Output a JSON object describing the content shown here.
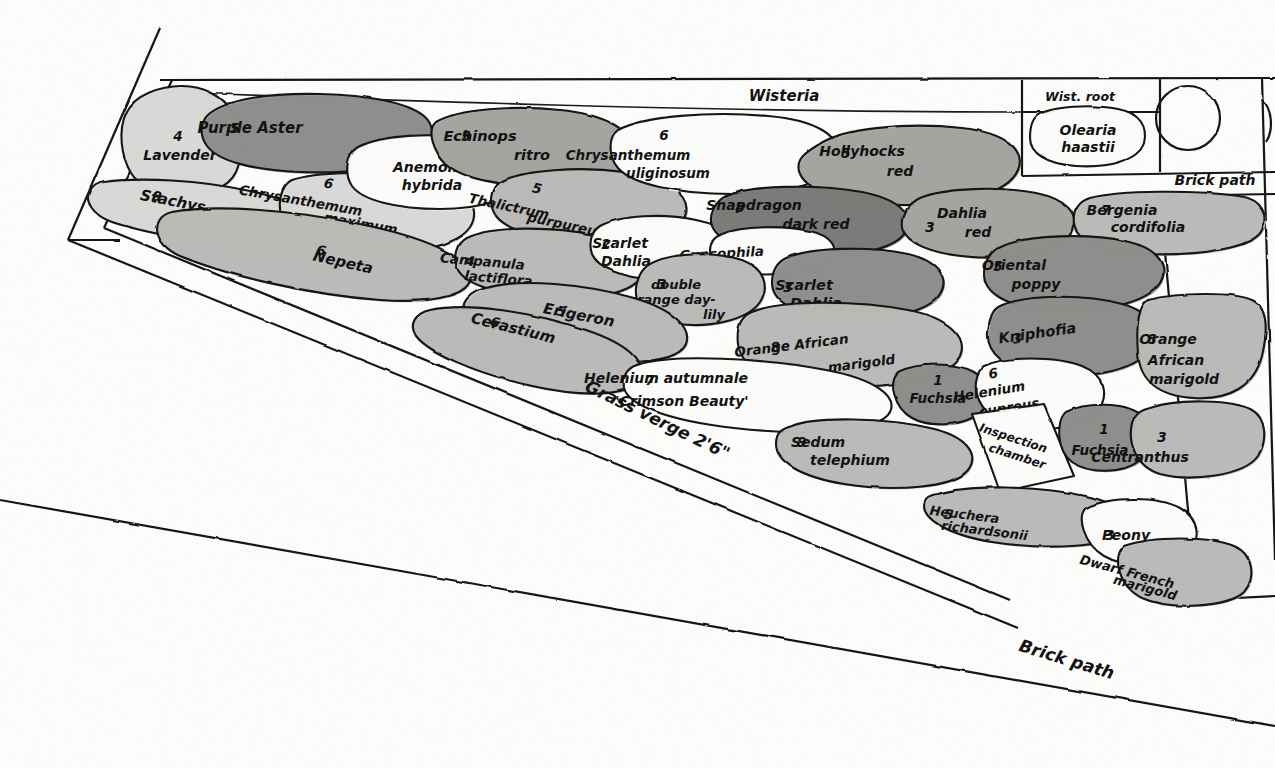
{
  "palette": {
    "paper": "#fdfdfb",
    "ink": "#141414",
    "tone_light": "#d8d8d6",
    "tone_mid": "#b9b9b7",
    "tone_mid_dark": "#a3a3a0",
    "tone_dark": "#8e8e8b",
    "tone_darkest": "#7a7a77",
    "white_bed": "#fbfbf9"
  },
  "structure_labels": [
    {
      "id": "wisteria",
      "text": "Wisteria",
      "x": 784,
      "y": 101,
      "size": 15,
      "rotate": 0,
      "anchor": "middle"
    },
    {
      "id": "wist-root",
      "text": "Wist. root",
      "x": 1080,
      "y": 101,
      "size": 12.5,
      "rotate": 0,
      "anchor": "middle"
    },
    {
      "id": "brick-path-top",
      "text": "Brick path",
      "x": 1215,
      "y": 185,
      "size": 14,
      "rotate": 0,
      "anchor": "middle"
    },
    {
      "id": "brick-path-bottom",
      "text": "Brick path",
      "x": 1065,
      "y": 665,
      "size": 17,
      "rotate": 17,
      "anchor": "middle"
    },
    {
      "id": "grass-verge",
      "text": "Grass verge 2'6\"",
      "x": 655,
      "y": 425,
      "size": 17,
      "rotate": 26,
      "anchor": "middle"
    }
  ],
  "beds": [
    {
      "id": "lavender",
      "qty": "4",
      "name": "Lavender",
      "tone": "tone_light",
      "path": "M126,113 C134,95 160,86 182,86 C203,86 224,96 232,112 C242,131 243,157 236,172 C228,189 204,196 184,195 C161,194 140,188 131,173 C121,156 118,131 126,113 Z",
      "label": {
        "x": 180,
        "y": 148,
        "lines": [
          "4"
        ],
        "sub": "Lavender",
        "numx": 178,
        "numy": 141,
        "textx": 180,
        "texty": 160,
        "size": 14
      }
    },
    {
      "id": "purple-aster",
      "qty": "5",
      "name": "Purple Aster",
      "tone": "tone_dark",
      "path": "M210,113 C230,99 270,93 320,94 C370,95 408,103 424,116 C436,126 434,144 420,154 C400,168 348,174 300,172 C252,170 218,161 207,146 C199,135 200,121 210,113 Z",
      "label": {
        "numx": 235,
        "numy": 133,
        "textx": 250,
        "texty": 133,
        "sub": "",
        "size": 15
      }
    },
    {
      "id": "stachys",
      "qty": "9",
      "name": "Stachys",
      "tone": "tone_light",
      "path": "M104,182 C140,177 200,180 250,191 C292,200 316,214 318,228 C320,243 298,250 262,248 C214,245 148,234 112,222 C92,215 84,200 90,191 C94,185 98,183 104,182 Z",
      "label": {
        "numx": 156,
        "numy": 201,
        "textx": 172,
        "texty": 206,
        "sub": "",
        "size": 15,
        "rotate": 11
      }
    },
    {
      "id": "chrysanthemum-maximum",
      "qty": "6",
      "name": "Chrysanthemum",
      "name2": "maximum",
      "tone": "tone_light",
      "path": "M292,180 C316,172 370,171 414,177 C452,183 476,197 474,216 C472,238 440,250 396,252 C348,254 306,246 290,232 C276,220 276,188 292,180 Z",
      "label": {
        "numx": 328,
        "numy": 188,
        "textx": 300,
        "texty": 205,
        "sub": "maximum",
        "subx": 360,
        "suby": 228,
        "size": 13.5,
        "rotate": 10
      }
    },
    {
      "id": "anemone-hybrida",
      "qty": "6",
      "name": "Anemone",
      "name2": "hybrida",
      "tone": "white_bed",
      "path": "M358,147 C382,135 432,132 470,139 C506,146 520,162 516,180 C512,200 480,209 440,209 C396,209 362,200 352,186 C344,174 346,154 358,147 Z",
      "label": {
        "numx": 440,
        "numy": 153,
        "textx": 430,
        "texty": 172,
        "sub": "hybrida",
        "subx": 432,
        "suby": 190,
        "size": 14
      }
    },
    {
      "id": "echinops-ritro",
      "qty": "5",
      "name": "Echinops",
      "name2": "ritro",
      "tone": "tone_mid_dark",
      "path": "M436,122 C458,109 514,105 560,110 C602,114 630,128 632,148 C634,171 604,184 556,186 C506,188 462,179 446,164 C434,152 426,131 436,122 Z",
      "label": {
        "numx": 466,
        "numy": 141,
        "textx": 480,
        "texty": 141,
        "sub": "ritro",
        "subx": 532,
        "suby": 160,
        "size": 14.5
      }
    },
    {
      "id": "thalictrum-purpureum",
      "qty": "5",
      "name": "Thalictrum",
      "name2": "purpureum",
      "tone": "tone_mid",
      "path": "M500,182 C522,170 580,166 624,172 C668,178 690,195 686,213 C682,234 640,244 594,243 C548,242 508,232 496,216 C488,204 490,188 500,182 Z",
      "label": {
        "numx": 536,
        "numy": 193,
        "textx": 508,
        "texty": 211,
        "sub": "purpureum",
        "subx": 568,
        "suby": 230,
        "size": 13.5,
        "rotate": 12
      }
    },
    {
      "id": "chrysanthemum-uliginosum",
      "qty": "6",
      "name": "Chrysanthemum",
      "name2": "uliginosum",
      "tone": "white_bed",
      "path": "M618,130 C644,116 710,111 768,116 C816,120 842,136 838,158 C834,182 790,194 732,194 C676,194 632,184 618,168 C608,156 608,137 618,130 Z",
      "label": {
        "numx": 664,
        "numy": 140,
        "textx": 628,
        "texty": 160,
        "sub": "uliginosum",
        "subx": 668,
        "suby": 178,
        "size": 13.5
      }
    },
    {
      "id": "hollyhocks-red",
      "qty": "5",
      "name": "Hollyhocks",
      "name2": "red",
      "tone": "tone_mid_dark",
      "path": "M818,145 C842,128 908,122 962,128 C1006,133 1026,150 1018,170 C1008,194 958,206 902,205 C846,204 808,192 800,174 C794,160 806,152 818,145 Z",
      "label": {
        "numx": 846,
        "numy": 158,
        "textx": 862,
        "texty": 156,
        "sub": "red",
        "subx": 900,
        "suby": 176,
        "size": 14
      }
    },
    {
      "id": "nepeta",
      "qty": "6",
      "name": "Nepeta",
      "tone": "tone_mid",
      "path": "M172,212 C214,204 292,210 360,224 C424,237 466,256 470,274 C474,294 438,304 380,300 C312,295 228,276 180,256 C152,244 150,217 172,212 Z",
      "label": {
        "numx": 320,
        "numy": 255,
        "textx": 342,
        "texty": 267,
        "sub": "",
        "size": 15,
        "rotate": 13
      }
    },
    {
      "id": "campanula-lactiflora",
      "qty": "4",
      "name": "Campanula",
      "name2": "lactiflora",
      "tone": "tone_mid",
      "path": "M466,238 C490,226 552,226 594,235 C632,243 648,258 642,275 C634,294 590,301 544,298 C500,295 466,285 458,270 C452,258 456,243 466,238 Z",
      "label": {
        "numx": 470,
        "numy": 266,
        "textx": 482,
        "texty": 266,
        "sub": "lactiflora",
        "subx": 498,
        "suby": 283,
        "size": 13.5,
        "rotate": 5
      }
    },
    {
      "id": "scarlet-dahlia-2",
      "qty": "2",
      "name": "Scarlet",
      "name2": "Dahlia",
      "tone": "white_bed",
      "path": "M600,226 C620,215 664,213 696,220 C726,226 740,240 734,256 C726,274 690,282 656,280 C622,278 598,268 592,254 C588,242 592,231 600,226 Z",
      "label": {
        "numx": 606,
        "numy": 249,
        "textx": 620,
        "texty": 248,
        "sub": "Dahlia",
        "subx": 626,
        "suby": 266,
        "size": 14
      }
    },
    {
      "id": "snapdragon-dark-red",
      "qty": "8",
      "name": "Snapdragon",
      "name2": "dark red",
      "tone": "tone_darkest",
      "path": "M726,196 C750,185 818,184 862,192 C898,199 914,214 906,231 C896,251 844,259 794,256 C748,253 718,242 712,226 C708,214 716,201 726,196 Z",
      "label": {
        "numx": 740,
        "numy": 212,
        "textx": 754,
        "texty": 210,
        "sub": "dark red",
        "subx": 816,
        "suby": 229,
        "size": 14
      }
    },
    {
      "id": "gypsophila",
      "qty": "",
      "name": "Gypsophila",
      "tone": "white_bed",
      "path": "M722,234 C742,226 784,225 810,231 C832,236 840,249 830,259 C818,271 782,276 752,274 C724,272 710,263 710,251 C710,242 714,237 722,234 Z",
      "label": {
        "numx": 0,
        "numy": 0,
        "textx": 722,
        "texty": 258,
        "sub": "",
        "size": 13.5,
        "rotate": -3
      }
    },
    {
      "id": "dahlia-red",
      "qty": "3",
      "name": "Dahlia",
      "name2": "red",
      "tone": "tone_mid_dark",
      "path": "M920,198 C944,188 1000,186 1036,193 C1066,199 1080,214 1072,230 C1062,250 1016,260 972,257 C930,254 906,243 902,227 C900,214 910,203 920,198 Z",
      "label": {
        "numx": 930,
        "numy": 232,
        "textx": 962,
        "texty": 218,
        "sub": "red",
        "subx": 978,
        "suby": 237,
        "size": 14
      }
    },
    {
      "id": "bergenia-cordifolia",
      "qty": "7",
      "name": "Bergenia",
      "name2": "cordifolia",
      "tone": "tone_mid",
      "path": "M1090,198 C1120,190 1196,190 1240,196 C1264,200 1268,216 1262,230 C1254,248 1200,256 1146,254 C1098,252 1076,240 1074,224 C1072,210 1080,201 1090,198 Z",
      "label": {
        "numx": 1106,
        "numy": 215,
        "textx": 1122,
        "texty": 215,
        "sub": "cordifolia",
        "subx": 1148,
        "suby": 232,
        "size": 14
      }
    },
    {
      "id": "olearia-haastii",
      "qty": "",
      "name": "Olearia",
      "name2": "haastii",
      "tone": "white_bed",
      "path": "M1038,115 C1052,106 1092,104 1118,109 C1140,113 1148,127 1144,143 C1138,161 1108,168 1076,166 C1046,164 1030,153 1030,138 C1030,127 1032,119 1038,115 Z",
      "label": {
        "numx": 0,
        "numy": 0,
        "textx": 1088,
        "texty": 135,
        "sub": "haastii",
        "subx": 1088,
        "suby": 152,
        "size": 14
      }
    },
    {
      "id": "double-orange-day-lily",
      "qty": "3",
      "name": "double",
      "name2": "orange day-",
      "name3": "lily",
      "tone": "tone_mid",
      "path": "M654,262 C676,252 718,252 742,260 C764,268 770,286 760,302 C748,320 710,328 678,324 C648,320 634,306 636,288 C638,274 644,266 654,262 Z",
      "label": {
        "numx": 662,
        "numy": 289,
        "textx": 676,
        "texty": 289,
        "sub": "orange day-",
        "subx": 672,
        "suby": 304,
        "sub2": "lily",
        "sub2x": 714,
        "sub2y": 319,
        "size": 13
      }
    },
    {
      "id": "scarlet-dahlia-3",
      "qty": "3",
      "name": "Scarlet",
      "name2": "Dahlia",
      "tone": "tone_dark",
      "path": "M786,258 C812,247 872,246 908,254 C938,261 950,278 940,294 C928,314 876,322 832,318 C792,314 772,300 772,283 C772,270 778,262 786,258 Z",
      "label": {
        "numx": 788,
        "numy": 292,
        "textx": 804,
        "texty": 290,
        "sub": "Dahlia",
        "subx": 816,
        "suby": 308,
        "size": 14.5
      }
    },
    {
      "id": "oriental-poppy",
      "qty": "5",
      "name": "Oriental",
      "name2": "poppy",
      "tone": "tone_dark",
      "path": "M1002,246 C1026,235 1088,233 1126,241 C1158,248 1170,266 1160,283 C1146,305 1092,314 1046,310 C1004,306 984,292 984,274 C984,260 992,250 1002,246 Z",
      "label": {
        "numx": 998,
        "numy": 271,
        "textx": 1014,
        "texty": 270,
        "sub": "poppy",
        "subx": 1036,
        "suby": 289,
        "size": 14
      }
    },
    {
      "id": "erigeron",
      "qty": "5",
      "name": "Erigeron",
      "tone": "tone_mid",
      "path": "M486,288 C520,278 586,284 634,298 C674,310 692,328 686,344 C678,362 632,366 580,358 C524,350 478,332 466,316 C458,303 470,292 486,288 Z",
      "label": {
        "numx": 560,
        "numy": 316,
        "textx": 578,
        "texty": 320,
        "sub": "",
        "size": 15,
        "rotate": 11
      }
    },
    {
      "id": "cerastium",
      "qty": "6",
      "name": "Cerastium",
      "tone": "tone_mid",
      "path": "M430,310 C468,302 534,312 586,330 C628,344 646,362 640,378 C632,396 586,398 532,386 C474,373 428,352 416,336 C408,324 416,313 430,310 Z",
      "label": {
        "numx": 494,
        "numy": 327,
        "textx": 512,
        "texty": 333,
        "sub": "",
        "size": 15,
        "rotate": 14
      }
    },
    {
      "id": "orange-african-marigold-8a",
      "qty": "8",
      "name": "Orange African",
      "name2": "marigold",
      "tone": "tone_mid",
      "path": "M752,312 C780,300 856,300 908,310 C950,318 968,338 960,356 C948,380 884,390 824,386 C768,382 740,366 738,344 C736,326 742,316 752,312 Z",
      "label": {
        "numx": 776,
        "numy": 352,
        "textx": 792,
        "texty": 350,
        "sub": "marigold",
        "subx": 862,
        "suby": 368,
        "size": 13.5,
        "rotate": -7
      }
    },
    {
      "id": "kniphofia",
      "qty": "3",
      "name": "Kniphofia",
      "tone": "tone_dark",
      "path": "M1000,306 C1026,294 1086,294 1122,304 C1152,312 1162,332 1150,350 C1134,372 1082,380 1040,374 C1004,369 986,352 988,332 C990,317 992,310 1000,306 Z",
      "label": {
        "numx": 1018,
        "numy": 343,
        "textx": 1038,
        "texty": 338,
        "sub": "",
        "size": 14.5,
        "rotate": -8
      }
    },
    {
      "id": "orange-african-marigold-8b",
      "qty": "8",
      "name": "Orange",
      "name2": "African",
      "name3": "marigold",
      "tone": "tone_mid",
      "path": "M1148,300 C1180,292 1234,292 1252,300 C1268,307 1268,330 1262,356 C1254,386 1230,400 1194,398 C1158,396 1140,380 1138,354 C1136,328 1138,306 1148,300 Z",
      "label": {
        "numx": 1152,
        "numy": 344,
        "textx": 1168,
        "texty": 344,
        "sub": "African",
        "subx": 1176,
        "suby": 365,
        "sub2": "marigold",
        "sub2x": 1184,
        "sub2y": 384,
        "size": 14
      }
    },
    {
      "id": "helenium-autumnale",
      "qty": "7",
      "name": "Helenium autumnale",
      "name2": "'Crimson Beauty'",
      "tone": "white_bed",
      "path": "M640,364 C676,354 762,358 826,370 C874,379 898,396 890,412 C880,432 804,436 734,428 C664,420 628,404 624,388 C622,374 628,367 640,364 Z",
      "label": {
        "numx": 650,
        "numy": 385,
        "textx": 666,
        "texty": 383,
        "sub": "'Crimson Beauty'",
        "subx": 682,
        "suby": 406,
        "size": 14
      }
    },
    {
      "id": "fuchsia-top",
      "qty": "1",
      "name": "Fuchsia",
      "tone": "tone_dark",
      "path": "M898,372 C918,362 956,362 974,372 C990,381 992,400 980,412 C966,426 930,428 912,418 C894,408 888,382 898,372 Z",
      "label": {
        "numx": 938,
        "numy": 385,
        "textx": 938,
        "texty": 403,
        "sub": "",
        "size": 13.5
      }
    },
    {
      "id": "helenium-cupreus",
      "qty": "6",
      "name": "Helenium",
      "name2": "cupreus",
      "tone": "white_bed",
      "path": "M984,366 C1004,356 1056,356 1082,366 C1104,375 1110,394 1098,410 C1084,428 1038,434 1010,426 C984,418 974,396 976,382 C978,372 980,368 984,366 Z",
      "label": {
        "numx": 994,
        "numy": 378,
        "textx": 990,
        "texty": 396,
        "sub": "cupreus",
        "subx": 1010,
        "suby": 412,
        "size": 13.5,
        "rotate": -9
      }
    },
    {
      "id": "sedum-telephium",
      "qty": "9",
      "name": "Sedum",
      "name2": "telephium",
      "tone": "tone_mid",
      "path": "M792,426 C816,416 886,418 930,428 C966,436 980,454 968,470 C954,488 894,492 844,484 C796,476 776,460 776,444 C776,432 782,429 792,426 Z",
      "label": {
        "numx": 802,
        "numy": 447,
        "textx": 818,
        "texty": 447,
        "sub": "telephium",
        "subx": 850,
        "suby": 465,
        "size": 14
      }
    },
    {
      "id": "inspection-chamber",
      "qty": "",
      "name": "Inspection",
      "name2": "chamber",
      "tone": "white_bed",
      "path": "M972,414 L1044,404 L1074,476 L1000,492 Z",
      "label": {
        "numx": 0,
        "numy": 0,
        "textx": 1012,
        "texty": 442,
        "sub": "chamber",
        "subx": 1016,
        "suby": 460,
        "size": 12,
        "rotate": 18
      }
    },
    {
      "id": "fuchsia-bottom",
      "qty": "1",
      "name": "Fuchsia",
      "tone": "tone_dark",
      "path": "M1066,412 C1086,402 1124,402 1140,414 C1154,425 1154,448 1140,460 C1124,474 1088,474 1072,462 C1056,450 1056,420 1066,412 Z",
      "label": {
        "numx": 1104,
        "numy": 434,
        "textx": 1100,
        "texty": 455,
        "sub": "",
        "size": 13.5
      }
    },
    {
      "id": "centranthus",
      "qty": "3",
      "name": "Centranthus",
      "tone": "tone_mid",
      "path": "M1150,408 C1178,398 1234,400 1252,410 C1266,418 1268,440 1258,456 C1244,476 1190,482 1160,474 C1134,466 1128,440 1132,424 C1136,412 1142,410 1150,408 Z",
      "label": {
        "numx": 1162,
        "numy": 442,
        "textx": 1140,
        "texty": 462,
        "sub": "",
        "size": 14
      }
    },
    {
      "id": "heuchera-richardsonii",
      "qty": "5",
      "name": "Heuchera",
      "name2": "richardsonii",
      "tone": "tone_mid",
      "path": "M938,494 C970,484 1040,486 1086,496 C1122,504 1134,520 1124,532 C1110,548 1044,550 992,542 C944,534 924,518 924,506 C924,497 930,495 938,494 Z",
      "label": {
        "numx": 948,
        "numy": 519,
        "textx": 964,
        "texty": 519,
        "sub": "richardsonii",
        "subx": 984,
        "suby": 535,
        "size": 13,
        "rotate": 7
      }
    },
    {
      "id": "peony",
      "qty": "3",
      "name": "Peony",
      "tone": "white_bed",
      "path": "M1086,508 C1110,496 1158,496 1180,508 C1200,519 1202,542 1186,554 C1168,568 1124,568 1104,556 C1084,544 1076,516 1086,508 Z",
      "label": {
        "numx": 1110,
        "numy": 540,
        "textx": 1126,
        "texty": 540,
        "sub": "",
        "size": 14
      }
    },
    {
      "id": "dwarf-french-marigold",
      "qty": "",
      "name": "Dwarf French",
      "name2": "marigold",
      "tone": "tone_mid",
      "path": "M1124,546 C1152,536 1210,536 1234,546 C1254,555 1256,578 1244,592 C1228,608 1168,610 1142,598 C1118,586 1112,556 1124,546 Z",
      "label": {
        "numx": 0,
        "numy": 0,
        "textx": 1126,
        "texty": 576,
        "sub": "marigold",
        "subx": 1144,
        "suby": 592,
        "size": 13,
        "rotate": 15
      }
    }
  ],
  "legend_note": "Numbers before each plant name indicate the quantity planted in that group."
}
